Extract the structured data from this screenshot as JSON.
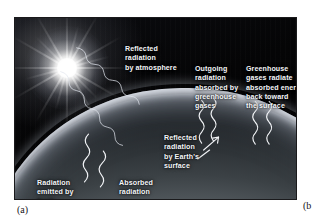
{
  "figure": {
    "panel_label_a": "(a)",
    "panel_label_b": "(b",
    "scene": {
      "sun": "sun-with-rays",
      "planet": "earth-limb",
      "ice_mass": "greenland-ice-sheet"
    },
    "labels": [
      {
        "id": "reflected-by-atmosphere",
        "text": "Reflected\nradiation\nby atmosphere"
      },
      {
        "id": "outgoing-absorbed-greenhouse",
        "text": "Outgoing\nradiation\nabsorbed by\ngreenhouse\ngases"
      },
      {
        "id": "greenhouse-radiate-back",
        "text": "Greenhouse\ngases radiate\nabsorbed energy\nback toward\nthe surface"
      },
      {
        "id": "reflected-by-earth-surface",
        "text": "Reflected\nradiation\nby Earth's\nsurface"
      },
      {
        "id": "radiation-emitted-by-earth",
        "text": "Radiation\nemitted by\nEarth"
      },
      {
        "id": "absorbed-radiation",
        "text": "Absorbed\nradiation"
      }
    ],
    "colors": {
      "label_text": "#f4f6f9",
      "ray_stroke": "#f2f4f7",
      "space_background": "#050507",
      "caption_text": "#15151a",
      "ice_white": "#ffffff",
      "page_background": "#ffffff"
    }
  }
}
